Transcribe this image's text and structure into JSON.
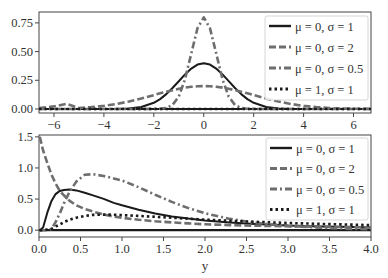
{
  "colors": {
    "black": "#1a1a1a",
    "gray": "#6e6e6e",
    "frame": "#444444",
    "legend_border": "#cccccc"
  },
  "chart_data": [
    {
      "type": "line",
      "title": "",
      "xlabel": "",
      "ylabel": "",
      "xlim": [
        -6.6,
        6.7
      ],
      "ylim": [
        -0.035,
        0.845
      ],
      "xticks": [
        -6,
        -4,
        -2,
        0,
        2,
        4,
        6
      ],
      "xtick_labels": [
        "−6",
        "−4",
        "−2",
        "0",
        "2",
        "4",
        "6"
      ],
      "yticks": [
        0.0,
        0.25,
        0.5,
        0.75
      ],
      "ytick_labels": [
        "0.00",
        "0.25",
        "0.50",
        "0.75"
      ],
      "grid": false,
      "legend_position": "upper right",
      "x": [
        -6.6,
        -6,
        -5.5,
        -5,
        -4.5,
        -4,
        -3.5,
        -3,
        -2.5,
        -2,
        -1.75,
        -1.5,
        -1.25,
        -1,
        -0.75,
        -0.5,
        -0.25,
        0,
        0.25,
        0.5,
        0.75,
        1,
        1.25,
        1.5,
        1.75,
        2,
        2.5,
        3,
        3.5,
        4,
        4.5,
        5,
        5.5,
        6,
        6.7
      ],
      "series": [
        {
          "name": "μ = 0, σ = 1",
          "style": "solid",
          "color": "#1a1a1a",
          "values": [
            0.0,
            0.0,
            0.0,
            0.0,
            0.0,
            0.0001,
            0.0009,
            0.0044,
            0.0175,
            0.054,
            0.0863,
            0.1295,
            0.1826,
            0.242,
            0.3011,
            0.3521,
            0.3867,
            0.3989,
            0.3867,
            0.3521,
            0.3011,
            0.242,
            0.1826,
            0.1295,
            0.0863,
            0.054,
            0.0175,
            0.0044,
            0.0009,
            0.0001,
            0.0,
            0.0,
            0.0,
            0.0,
            0.0
          ]
        },
        {
          "name": "μ = 0, σ = 2",
          "style": "dashed",
          "color": "#6e6e6e",
          "values": [
            0.0086,
            0.0222,
            0.0451,
            0.0088,
            0.016,
            0.027,
            0.0431,
            0.0648,
            0.0913,
            0.121,
            0.1363,
            0.1506,
            0.1633,
            0.176,
            0.1862,
            0.1933,
            0.1975,
            0.1995,
            0.1975,
            0.1933,
            0.1862,
            0.176,
            0.1633,
            0.1506,
            0.1363,
            0.121,
            0.0913,
            0.0648,
            0.0431,
            0.027,
            0.016,
            0.0088,
            0.0045,
            0.0022,
            0.0009
          ]
        },
        {
          "name": "μ = 0, σ = 0.5",
          "style": "dashdot",
          "color": "#6e6e6e",
          "values": [
            0,
            0,
            0,
            0,
            0,
            0,
            0,
            0,
            0,
            0.0003,
            0.0018,
            0.0089,
            0.0347,
            0.108,
            0.259,
            0.4839,
            0.7041,
            0.7979,
            0.7041,
            0.4839,
            0.259,
            0.108,
            0.0347,
            0.0089,
            0.0018,
            0.0003,
            0,
            0,
            0,
            0,
            0,
            0,
            0,
            0,
            0
          ]
        },
        {
          "name": "μ = 1, σ = 1",
          "style": "dotted",
          "color": "#1a1a1a",
          "values": [
            0,
            0,
            0,
            0,
            0,
            0,
            0,
            0,
            0,
            0,
            0,
            0,
            0,
            0,
            0,
            0,
            0,
            0,
            0,
            0,
            0,
            0,
            0,
            0,
            0,
            0,
            0,
            0,
            0,
            0,
            0,
            0,
            0,
            0,
            0
          ]
        }
      ]
    },
    {
      "type": "line",
      "title": "",
      "xlabel": "y",
      "ylabel": "",
      "xlim": [
        0.0,
        4.0
      ],
      "ylim": [
        -0.11,
        1.53
      ],
      "xticks": [
        0.0,
        0.5,
        1.0,
        1.5,
        2.0,
        2.5,
        3.0,
        3.5,
        4.0
      ],
      "xtick_labels": [
        "0.0",
        "0.5",
        "1.0",
        "1.5",
        "2.0",
        "2.5",
        "3.0",
        "3.5",
        "4.0"
      ],
      "yticks": [
        0.0,
        0.5,
        1.0,
        1.5
      ],
      "ytick_labels": [
        "0.0",
        "0.5",
        "1.0",
        "1.5"
      ],
      "grid": false,
      "legend_position": "upper right",
      "x": [
        0.01,
        0.05,
        0.1,
        0.15,
        0.2,
        0.25,
        0.3,
        0.37,
        0.45,
        0.55,
        0.65,
        0.78,
        0.9,
        1.0,
        1.2,
        1.4,
        1.6,
        1.8,
        2.0,
        2.3,
        2.6,
        3.0,
        3.4,
        3.8,
        4.0
      ],
      "series": [
        {
          "name": "μ = 0, σ = 1",
          "style": "solid",
          "color": "#1a1a1a",
          "values": [
            0.0,
            0.0445,
            0.2815,
            0.4704,
            0.5794,
            0.6316,
            0.6442,
            0.6552,
            0.6389,
            0.601,
            0.5587,
            0.5022,
            0.4385,
            0.3989,
            0.3295,
            0.2675,
            0.2215,
            0.1855,
            0.1569,
            0.124,
            0.101,
            0.0727,
            0.0594,
            0.0484,
            0.0436
          ]
        },
        {
          "name": "μ = 0, σ = 2",
          "style": "dashed",
          "color": "#6e6e6e",
          "values": [
            1.5,
            1.28,
            1.08,
            0.89,
            0.75,
            0.63,
            0.56,
            0.47,
            0.4,
            0.34,
            0.3,
            0.25,
            0.22,
            0.199,
            0.167,
            0.143,
            0.124,
            0.108,
            0.095,
            0.082,
            0.072,
            0.062,
            0.054,
            0.047,
            0.044
          ]
        },
        {
          "name": "μ = 0, σ = 0.5",
          "style": "dashdot",
          "color": "#6e6e6e",
          "values": [
            0.0,
            0.0,
            0.0,
            0.02,
            0.13,
            0.27,
            0.43,
            0.62,
            0.78,
            0.89,
            0.9,
            0.87,
            0.83,
            0.798,
            0.69,
            0.568,
            0.454,
            0.354,
            0.271,
            0.181,
            0.118,
            0.068,
            0.038,
            0.021,
            0.016
          ]
        },
        {
          "name": "μ = 1, σ = 1",
          "style": "dotted",
          "color": "#1a1a1a",
          "values": [
            0.0,
            0.0,
            0.01,
            0.02,
            0.06,
            0.09,
            0.13,
            0.17,
            0.2,
            0.23,
            0.245,
            0.25,
            0.248,
            0.242,
            0.23,
            0.215,
            0.2,
            0.185,
            0.17,
            0.15,
            0.135,
            0.115,
            0.1,
            0.087,
            0.08
          ]
        }
      ]
    }
  ],
  "legend": {
    "items": [
      {
        "label": "μ = 0, σ = 1"
      },
      {
        "label": "μ = 0, σ = 2"
      },
      {
        "label": "μ = 0, σ = 0.5"
      },
      {
        "label": "μ = 1, σ = 1"
      }
    ]
  }
}
